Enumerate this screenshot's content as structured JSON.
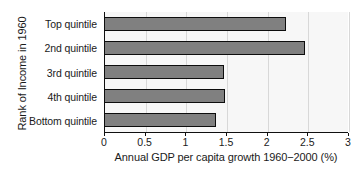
{
  "chart_data": {
    "type": "bar",
    "orientation": "horizontal",
    "title": "",
    "xlabel": "Annual GDP per capita growth 1960−2000 (%)",
    "ylabel": "Rank of Income in 1960",
    "categories": [
      "Top quintile",
      "2nd quintile",
      "3rd quintile",
      "4th quintile",
      "Bottom quintile"
    ],
    "values": [
      2.23,
      2.46,
      1.46,
      1.47,
      1.37
    ],
    "xlim": [
      0,
      3
    ],
    "xticks": [
      0,
      0.5,
      1,
      1.5,
      2,
      2.5,
      3
    ],
    "xtick_labels": [
      "0",
      "0.5",
      "1",
      "1.5",
      "2",
      "2.5",
      "3"
    ],
    "grid": "vertical",
    "legend": "none",
    "bar_color": "#808080",
    "bar_edge_color": "#0d0d0d",
    "plot_background": "#f7f7f7",
    "gridline_color": "#d8d8d8",
    "axis_color": "#101010"
  }
}
